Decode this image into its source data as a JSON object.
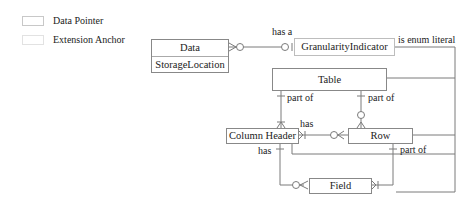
{
  "legend": {
    "items": [
      {
        "label": "Data Pointer"
      },
      {
        "label": "Extension Anchor"
      }
    ]
  },
  "entities": {
    "data": {
      "name": "Data",
      "attributes": [
        "StorageLocation"
      ]
    },
    "granularity": {
      "name": "GranularityIndicator"
    },
    "table": {
      "name": "Table"
    },
    "column_header": {
      "name": "Column Header"
    },
    "row": {
      "name": "Row"
    },
    "field": {
      "name": "Field"
    }
  },
  "relationships": {
    "data_granularity": "has a",
    "granularity_enum": "is enum literal",
    "table_column_header": "part of",
    "table_row": "part of",
    "column_header_row": "has",
    "column_header_field": "has",
    "row_field": "part of"
  },
  "colors": {
    "line": "#7a7a7a",
    "entity_border": "#888888",
    "legend_border": "#c8c8c8"
  }
}
